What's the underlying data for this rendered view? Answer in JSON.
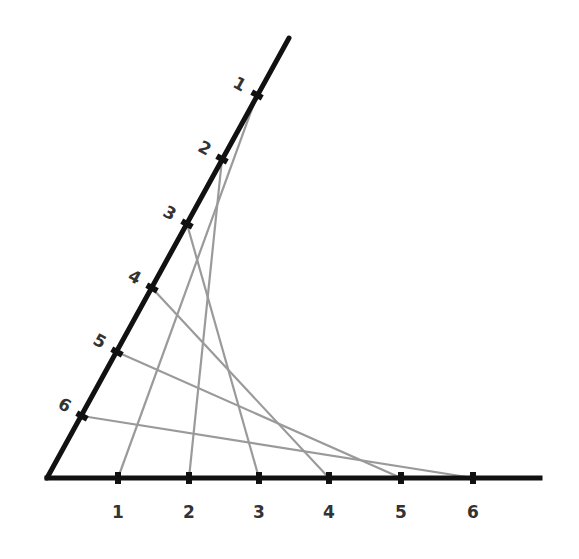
{
  "diagram": {
    "colors": {
      "axis": "#111111",
      "string": "#9a9a9a",
      "label": "#333333",
      "background": "#ffffff"
    },
    "origin": [
      47,
      478
    ],
    "horizontal_axis": {
      "end": [
        540,
        478
      ],
      "ticks": [
        {
          "label": "1",
          "x": 118,
          "y": 478
        },
        {
          "label": "2",
          "x": 189,
          "y": 478
        },
        {
          "label": "3",
          "x": 259,
          "y": 478
        },
        {
          "label": "4",
          "x": 329,
          "y": 478
        },
        {
          "label": "5",
          "x": 401,
          "y": 478
        },
        {
          "label": "6",
          "x": 473,
          "y": 478
        }
      ]
    },
    "slanted_axis": {
      "end": [
        289,
        38
      ],
      "ticks": [
        {
          "label": "1",
          "x": 257,
          "y": 95
        },
        {
          "label": "2",
          "x": 222,
          "y": 159
        },
        {
          "label": "3",
          "x": 187,
          "y": 224
        },
        {
          "label": "4",
          "x": 152,
          "y": 288
        },
        {
          "label": "5",
          "x": 117,
          "y": 352
        },
        {
          "label": "6",
          "x": 82,
          "y": 416
        }
      ]
    },
    "connections": [
      {
        "from": "slanted-1",
        "to": "horizontal-1"
      },
      {
        "from": "slanted-2",
        "to": "horizontal-2"
      },
      {
        "from": "slanted-3",
        "to": "horizontal-3"
      },
      {
        "from": "slanted-4",
        "to": "horizontal-4"
      },
      {
        "from": "slanted-5",
        "to": "horizontal-5"
      },
      {
        "from": "slanted-6",
        "to": "horizontal-6"
      }
    ]
  }
}
